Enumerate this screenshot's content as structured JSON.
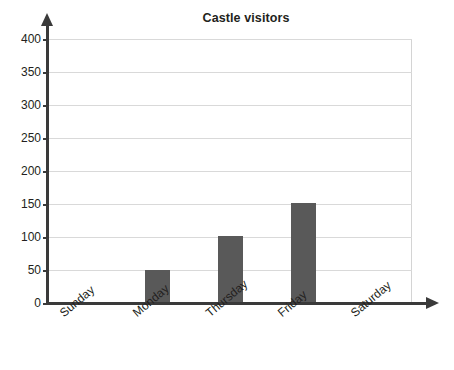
{
  "chart_data": {
    "type": "bar",
    "title": "Castle visitors",
    "xlabel": "",
    "ylabel": "",
    "categories": [
      "Sunday",
      "Monday",
      "Thursday",
      "Friday",
      "Saturday"
    ],
    "values": [
      0,
      50,
      102,
      152,
      0
    ],
    "ylim": [
      0,
      400
    ],
    "ytick_labels": [
      "0",
      "50",
      "100",
      "150",
      "200",
      "250",
      "300",
      "350",
      "400"
    ],
    "ytick_values": [
      0,
      50,
      100,
      150,
      200,
      250,
      300,
      350,
      400
    ],
    "grid": true,
    "legend": false,
    "bar_color": "#595959",
    "gridline_color": "#d9d9d9",
    "axis_color": "#3a3a3a",
    "text_color": "#231f20",
    "background_color": "#ffffff"
  }
}
